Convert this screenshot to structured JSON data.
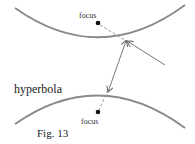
{
  "figure": {
    "caption": "Fig. 13",
    "curve_label": "hyperbola",
    "upper_focus_label": "focus",
    "lower_focus_label": "focus",
    "colors": {
      "curve": "#8a8a8a",
      "arrow": "#777777",
      "dashed": "#999999",
      "focus_dot": "#111111",
      "text": "#222222"
    }
  }
}
